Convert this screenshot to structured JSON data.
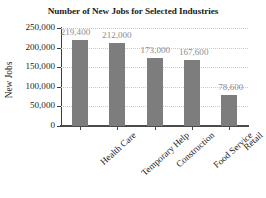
{
  "chart_data": {
    "type": "bar",
    "title": "Number of New Jobs for Selected Industries",
    "xlabel": "",
    "ylabel": "New Jobs",
    "categories": [
      "Health Care",
      "Temporary Help",
      "Construction",
      "Food Service",
      "Retail"
    ],
    "values": [
      219400,
      212000,
      173000,
      167600,
      78600
    ],
    "value_labels": [
      "219,400",
      "212,000",
      "173,000",
      "167,600",
      "78,600"
    ],
    "ylim": [
      0,
      250000
    ],
    "ytick_values": [
      0,
      50000,
      100000,
      150000,
      200000,
      250000
    ],
    "ytick_labels": [
      "0",
      "50,000",
      "100,000",
      "150,000",
      "200,000",
      "250,000"
    ],
    "grid": "horizontal-dotted",
    "legend": "none",
    "bar_color": "#7d7d7d",
    "value_label_color": "#8c8c8c",
    "axis_color": "#3c3c3c",
    "grid_color": "#c8c8c8"
  }
}
